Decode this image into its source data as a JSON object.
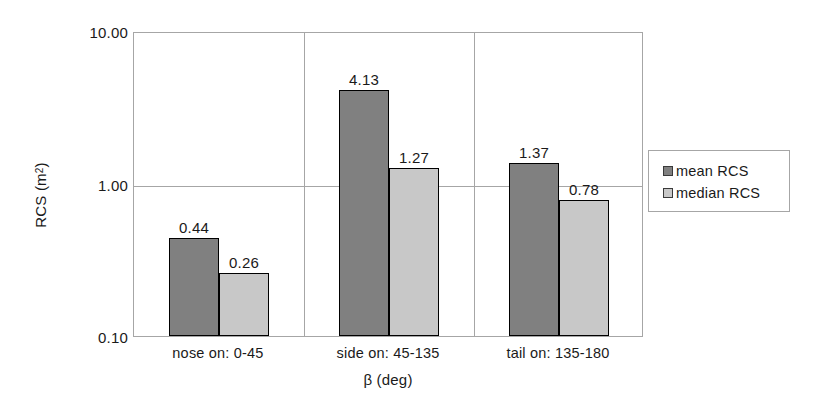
{
  "chart_data": {
    "type": "bar",
    "title": "",
    "xlabel": "β (deg)",
    "ylabel": "RCS (m²)",
    "ylabel_base": "RCS (m",
    "ylabel_sup": "2",
    "ylabel_close": ")",
    "yscale": "log",
    "ylim": [
      0.1,
      10.0
    ],
    "grid": true,
    "legend_position": "right-outside",
    "categories": [
      "nose on:  0-45",
      "side on: 45-135",
      "tail on: 135-180"
    ],
    "y_ticks": [
      "10.00",
      "1.00",
      "0.10"
    ],
    "y_tick_values": [
      10.0,
      1.0,
      0.1
    ],
    "series": [
      {
        "name": "mean RCS",
        "color": "#808080",
        "values": [
          0.44,
          4.13,
          1.37
        ],
        "labels": [
          "0.44",
          "4.13",
          "1.37"
        ]
      },
      {
        "name": "median RCS",
        "color": "#c8c8c8",
        "values": [
          0.26,
          1.27,
          0.78
        ],
        "labels": [
          "0.26",
          "1.27",
          "0.78"
        ]
      }
    ]
  },
  "legend": {
    "items": [
      {
        "label": "mean RCS",
        "swatch": "#808080"
      },
      {
        "label": "median RCS",
        "swatch": "#c8c8c8"
      }
    ]
  }
}
